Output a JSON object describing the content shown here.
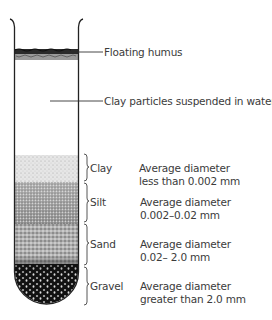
{
  "diagram": {
    "callouts": [
      {
        "id": "humus",
        "label": "Floating humus"
      },
      {
        "id": "suspended",
        "label": "Clay particles suspended in water"
      }
    ],
    "layers": [
      {
        "name": "Clay",
        "line1": "Average diameter",
        "line2": "less than 0.002 mm",
        "shade": "#d8d8d8"
      },
      {
        "name": "Silt",
        "line1": "Average diameter",
        "line2": "0.002–0.02 mm",
        "shade": "#8a8a8a"
      },
      {
        "name": "Sand",
        "line1": "Average diameter",
        "line2": "0.02– 2.0 mm",
        "shade": "#9a9a9a"
      },
      {
        "name": "Gravel",
        "line1": "Average diameter",
        "line2": "greater than 2.0 mm",
        "shade": "#1a1a1a"
      }
    ]
  }
}
